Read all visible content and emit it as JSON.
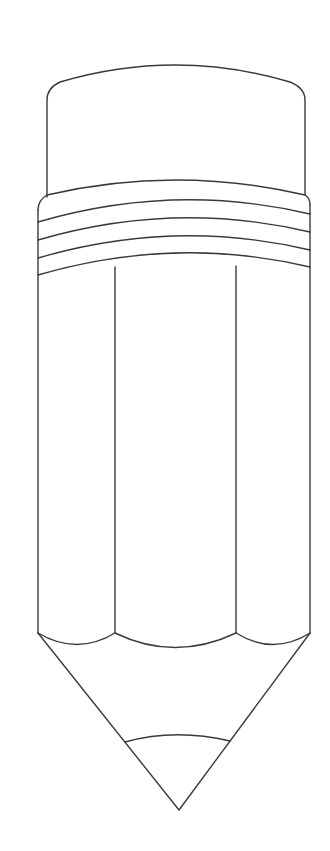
{
  "image": {
    "subject": "pencil line drawing",
    "background": "#ffffff",
    "stroke_color": "#3a3a3a"
  }
}
